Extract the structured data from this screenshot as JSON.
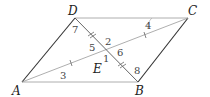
{
  "diagram": {
    "type": "parallelogram with diagonals",
    "vertices": {
      "A": {
        "label": "A",
        "x": 22,
        "y": 82
      },
      "B": {
        "label": "B",
        "x": 138,
        "y": 82
      },
      "C": {
        "label": "C",
        "x": 188,
        "y": 18
      },
      "D": {
        "label": "D",
        "x": 75,
        "y": 18
      }
    },
    "intersection": {
      "label": "E",
      "x": 107,
      "y": 50
    },
    "angle_labels": [
      "1",
      "2",
      "3",
      "4",
      "5",
      "6",
      "7",
      "8"
    ],
    "colors": {
      "line": "#333333",
      "thin_line": "#888888"
    }
  }
}
